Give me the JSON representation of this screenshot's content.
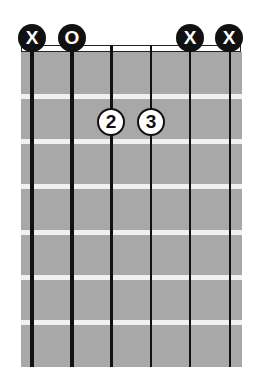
{
  "chord": {
    "strings": 6,
    "frets_shown": 7,
    "string_markers": [
      "X",
      "O",
      "",
      "",
      "X",
      "X"
    ],
    "fingers": [
      {
        "string": 3,
        "fret": 2,
        "label": "2"
      },
      {
        "string": 4,
        "fret": 2,
        "label": "3"
      }
    ]
  },
  "markers": {
    "s1": "X",
    "s2": "O",
    "s5": "X",
    "s6": "X"
  },
  "fingers": {
    "f1": "2",
    "f2": "3"
  },
  "colors": {
    "fretboard": "#a8a8a8",
    "fret_line": "#f0f0f0",
    "string": "#111111",
    "marker_bg": "#111111"
  }
}
